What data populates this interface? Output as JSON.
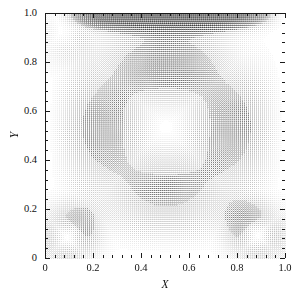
{
  "figure": {
    "type": "quiver",
    "background": "#ffffff",
    "frame_color": "#1a1a1a",
    "arrow_color": "#000000"
  },
  "axes": {
    "x_title": "X",
    "y_title": "Y",
    "x_ticklabels": [
      "0",
      "0.2",
      "0.4",
      "0.6",
      "0.8",
      "1.0"
    ],
    "y_ticklabels": [
      "0",
      "0.2",
      "0.4",
      "0.6",
      "0.8",
      "1.0"
    ]
  },
  "chart_data": {
    "type": "scatter",
    "plot_kind": "velocity-vector-field",
    "title": "",
    "xlabel": "X",
    "ylabel": "Y",
    "xlim": [
      0,
      1
    ],
    "ylim": [
      0,
      1
    ],
    "xticks": [
      0,
      0.2,
      0.4,
      0.6,
      0.8,
      1.0
    ],
    "yticks": [
      0,
      0.2,
      0.4,
      0.6,
      0.8,
      1.0
    ],
    "xticklabels": [
      "0",
      "0.2",
      "0.4",
      "0.6",
      "0.8",
      "1.0"
    ],
    "yticklabels": [
      "0",
      "0.2",
      "0.4",
      "0.6",
      "0.8",
      "1.0"
    ],
    "minor_ticks_per_interval": 4,
    "tick_direction": "in",
    "grid": false,
    "legend": null,
    "annotations": [],
    "field": {
      "description": "Lid-driven square cavity flow: dense grid of velocity vectors. Top lid moves in +X, driving a primary clockwise vortex whose core sits near the cavity centre (light/slow region). Boundary layers along the lid, left wall, right wall and floor appear dark because vectors there are long and densely overlapping. Secondary corner eddies appear at the lower-left and lower-right corners.",
      "grid_nx": 118,
      "grid_ny": 120,
      "primary_vortex_center": [
        0.52,
        0.56
      ],
      "secondary_vortices": [
        {
          "name": "lower-left",
          "center": [
            0.09,
            0.09
          ],
          "sense": "counter-clockwise"
        },
        {
          "name": "lower-right",
          "center": [
            0.88,
            0.1
          ],
          "sense": "counter-clockwise"
        },
        {
          "name": "upper-left",
          "center": [
            0.07,
            0.92
          ],
          "sense": "counter-clockwise"
        }
      ],
      "lid_velocity": 1.0,
      "lid_edge": "top",
      "max_speed": 1.0,
      "min_speed": 0.0,
      "arrow_scale": 0.017,
      "dark_bands": [
        {
          "region": "top lid boundary layer",
          "y_range": [
            0.88,
            1.0
          ]
        },
        {
          "region": "left wall boundary layer",
          "x_range": [
            0.0,
            0.13
          ]
        },
        {
          "region": "right wall boundary layer",
          "x_range": [
            0.86,
            1.0
          ]
        },
        {
          "region": "floor boundary layer",
          "y_range": [
            0.0,
            0.12
          ]
        }
      ],
      "light_core": {
        "x_range": [
          0.3,
          0.72
        ],
        "y_range": [
          0.4,
          0.7
        ]
      }
    }
  }
}
